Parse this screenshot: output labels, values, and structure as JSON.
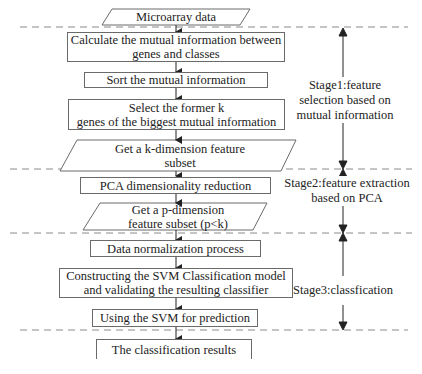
{
  "diagram": {
    "type": "flowchart",
    "nodes": [
      {
        "id": "n1",
        "shape": "parallelogram",
        "label": "Microarray data"
      },
      {
        "id": "n2",
        "shape": "rectangle",
        "line1": "Calculate the mutual information between",
        "line2": "genes and classes"
      },
      {
        "id": "n3",
        "shape": "rectangle",
        "label": "Sort the mutual information"
      },
      {
        "id": "n4",
        "shape": "rectangle",
        "line1": "Select the former k",
        "line2": "genes of the biggest mutual information"
      },
      {
        "id": "n5",
        "shape": "parallelogram",
        "line1": "Get a k-dimension feature",
        "line2": "subset"
      },
      {
        "id": "n6",
        "shape": "rectangle",
        "label": "PCA dimensionality reduction"
      },
      {
        "id": "n7",
        "shape": "parallelogram",
        "line1": "Get a p-dimension",
        "line2": "feature subset (p<k)"
      },
      {
        "id": "n8",
        "shape": "rectangle",
        "label": "Data normalization process"
      },
      {
        "id": "n9",
        "shape": "rectangle",
        "line1": "Constructing the SVM Classification model",
        "line2": "and validating the resulting classifier"
      },
      {
        "id": "n10",
        "shape": "rectangle",
        "label": "Using the SVM for prediction"
      },
      {
        "id": "n11",
        "shape": "rectangle",
        "label": "The classification results"
      }
    ],
    "edges": [
      [
        "n1",
        "n2"
      ],
      [
        "n2",
        "n3"
      ],
      [
        "n3",
        "n4"
      ],
      [
        "n4",
        "n5"
      ],
      [
        "n5",
        "n6"
      ],
      [
        "n6",
        "n7"
      ],
      [
        "n7",
        "n8"
      ],
      [
        "n8",
        "n9"
      ],
      [
        "n9",
        "n10"
      ],
      [
        "n10",
        "n11"
      ]
    ],
    "stages": [
      {
        "id": "stage1",
        "line1": "Stage1:feature",
        "line2": "selection based on",
        "line3": "mutual information"
      },
      {
        "id": "stage2",
        "line1": "Stage2:feature extraction",
        "line2": "based on PCA"
      },
      {
        "id": "stage3",
        "line1": "Stage3:classfication"
      }
    ],
    "colors": {
      "line": "#6a6a6a",
      "dash": "#8a8a8a",
      "arrow": "#222222",
      "text": "#222222"
    }
  }
}
